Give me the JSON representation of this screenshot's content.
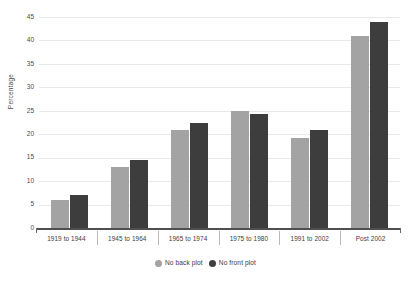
{
  "chart_data": {
    "type": "bar",
    "title": "",
    "subtitle": "",
    "xlabel": "",
    "ylabel": "Percentage",
    "ylim": [
      0,
      45
    ],
    "ytick_step": 5,
    "yticks": [
      0,
      5,
      10,
      15,
      20,
      25,
      30,
      35,
      40,
      45
    ],
    "grid": true,
    "legend_position": "bottom",
    "categories": [
      "1919  to 1944",
      "1945 to 1964",
      "1965 to 1974",
      "1975 to 1980",
      "1991 to 2002",
      "Post 2002"
    ],
    "series": [
      {
        "name": "No back plot",
        "color": "#a3a3a3",
        "values": [
          6,
          13,
          21,
          25,
          19.3,
          41
        ]
      },
      {
        "name": "No front plot",
        "color": "#3d3d3d",
        "values": [
          7,
          14.5,
          22.3,
          24.3,
          21,
          44
        ]
      }
    ]
  },
  "axis": {
    "y_title": "Percentage"
  },
  "legend": {
    "items": [
      {
        "label": "No back plot",
        "swatch": "legend-swatch-back",
        "color": "#a3a3a3"
      },
      {
        "label": "No front plot",
        "swatch": "legend-swatch-front",
        "color": "#3d3d3d"
      }
    ]
  }
}
